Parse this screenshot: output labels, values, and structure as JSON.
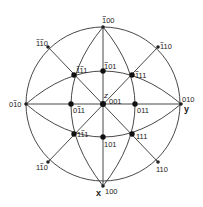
{
  "diagram": {
    "type": "stereographic-projection",
    "center": [
      103,
      104
    ],
    "radius": 77,
    "axes": {
      "x": "x",
      "y": "y",
      "z": "z"
    },
    "poles": [
      {
        "id": "p001",
        "label": "001",
        "x": 103,
        "y": 104,
        "lx": 110,
        "ly": 102,
        "major": true
      },
      {
        "id": "p100",
        "label": "100",
        "x": 103,
        "y": 186,
        "lx": 107,
        "ly": 193,
        "major": false
      },
      {
        "id": "pm100",
        "label": "̅100",
        "x": 103,
        "y": 27,
        "lx": 102,
        "ly": 22,
        "major": false
      },
      {
        "id": "p010",
        "label": "010",
        "x": 181,
        "y": 104,
        "lx": 182,
        "ly": 102,
        "major": false
      },
      {
        "id": "p0m10",
        "label": "0̅1̅0",
        "x": 26,
        "y": 104,
        "lx": 8,
        "ly": 107,
        "major": false
      },
      {
        "id": "p011",
        "label": "011",
        "x": 135,
        "y": 104,
        "lx": 137,
        "ly": 113,
        "major": true
      },
      {
        "id": "p0m11",
        "label": "01̅1",
        "x": 71,
        "y": 104,
        "lx": 73,
        "ly": 113,
        "major": true
      },
      {
        "id": "p101",
        "label": "101",
        "x": 103,
        "y": 137,
        "lx": 104,
        "ly": 146,
        "major": true
      },
      {
        "id": "pm101",
        "label": "1̅ 01",
        "x": 103,
        "y": 71,
        "lx": 104,
        "ly": 68,
        "major": true
      },
      {
        "id": "p111",
        "label": "111",
        "x": 132,
        "y": 134,
        "lx": 137,
        "ly": 138,
        "major": true
      },
      {
        "id": "p1m11",
        "label": "11̅1",
        "x": 74,
        "y": 134,
        "lx": 77,
        "ly": 136,
        "major": true
      },
      {
        "id": "pm111",
        "label": "1̅11",
        "x": 132,
        "y": 75,
        "lx": 135,
        "ly": 79,
        "major": true
      },
      {
        "id": "pm1m11",
        "label": "1̅1̅1",
        "x": 74,
        "y": 75,
        "lx": 76,
        "ly": 71,
        "major": true
      },
      {
        "id": "p110",
        "label": "110",
        "x": 158,
        "y": 162,
        "lx": 156,
        "ly": 172,
        "major": false
      },
      {
        "id": "p1m10",
        "label": "11̅0",
        "x": 48,
        "y": 162,
        "lx": 36,
        "ly": 170,
        "major": false
      },
      {
        "id": "pm110",
        "label": "1̅10",
        "x": 158,
        "y": 47,
        "lx": 160,
        "ly": 48,
        "major": false
      },
      {
        "id": "pm1m10",
        "label": "1̅1̅0",
        "x": 48,
        "y": 47,
        "lx": 36,
        "ly": 46,
        "major": false
      }
    ],
    "labels": {
      "x_axis": "x",
      "y_axis": "y",
      "z_axis": "z",
      "p001": "001",
      "p100": "100",
      "pm100": "100",
      "p010": "010",
      "p0m10": "010",
      "p011": "011",
      "p0m11": "011",
      "p101": "101",
      "pm101": "101",
      "p111": "111",
      "p1m11": "111",
      "pm111": "111",
      "pm1m11": "111",
      "p110": "110",
      "p1m10": "110",
      "pm110": "110",
      "pm1m10": "110"
    },
    "colors": {
      "line": "#333333",
      "text": "#222222",
      "background": "#ffffff"
    }
  }
}
